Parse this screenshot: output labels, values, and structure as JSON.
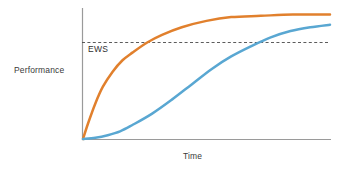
{
  "chart_data": {
    "type": "line",
    "title": "",
    "subtitle": "",
    "xlabel": "Time",
    "ylabel": "Performance",
    "grid": false,
    "legend_position": "none",
    "axes": {
      "x_ticks": [],
      "y_ticks": [],
      "xlim": [
        0,
        100
      ],
      "ylim": [
        0,
        100
      ],
      "x_axis_color": "#9a9a9a",
      "y_axis_color": "#9a9a9a"
    },
    "annotations": [
      {
        "name": "ews-threshold",
        "label": "EWS",
        "type": "horizontal-threshold-line",
        "y": 76,
        "style": "dashed",
        "color": "#4a4a4a",
        "label_position": "below-left"
      }
    ],
    "series": [
      {
        "name": "fast-adopter",
        "color": "#e1802d",
        "x": [
          0,
          2,
          5,
          8,
          12,
          16,
          20,
          26,
          32,
          40,
          50,
          60,
          72,
          85,
          100
        ],
        "values": [
          0,
          12,
          28,
          41,
          53,
          62,
          68,
          76,
          82,
          88,
          93,
          96,
          97,
          98,
          98
        ],
        "crosses_threshold_at_x": 41
      },
      {
        "name": "slow-adopter",
        "color": "#59a7d2",
        "x": [
          0,
          5,
          10,
          15,
          20,
          28,
          36,
          44,
          52,
          60,
          68,
          76,
          84,
          92,
          100
        ],
        "values": [
          0,
          1,
          3,
          6,
          11,
          20,
          31,
          43,
          55,
          65,
          73,
          80,
          85,
          88,
          90
        ],
        "crosses_threshold_at_x": 67
      }
    ]
  }
}
